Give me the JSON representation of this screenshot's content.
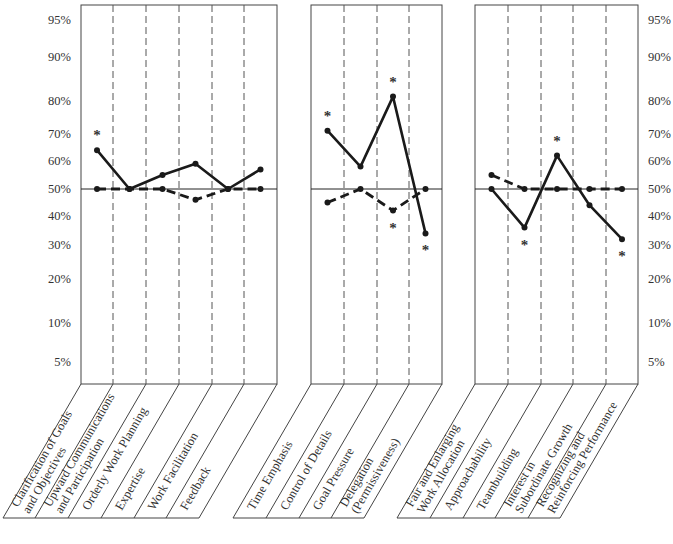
{
  "chart_data": [
    {
      "type": "line",
      "panel": "left",
      "title": "",
      "categories": [
        "Clarification of Goals and Objectives",
        "Upward Communications and Participation",
        "Orderly Work Planning",
        "Expertise",
        "Work Facilitation",
        "Feedback"
      ],
      "category_lines": [
        [
          "Clarification of Goals",
          "and Objectives"
        ],
        [
          "Upward Communications",
          "and Participation"
        ],
        [
          "Orderly Work Planning"
        ],
        [
          "Expertise"
        ],
        [
          "Work Facilitation"
        ],
        [
          "Feedback"
        ]
      ],
      "series": [
        {
          "name": "solid",
          "style": "solid",
          "values": [
            64,
            50,
            55,
            59,
            50,
            57
          ]
        },
        {
          "name": "dashed",
          "style": "dashed",
          "values": [
            50,
            50,
            50,
            46,
            50,
            50
          ]
        }
      ],
      "significance_markers": [
        {
          "series": "solid",
          "index": 0,
          "position": "above"
        }
      ],
      "ylabel": "",
      "xlabel": "",
      "yticks": [
        "95%",
        "90%",
        "80%",
        "70%",
        "60%",
        "50%",
        "40%",
        "30%",
        "20%",
        "10%",
        "5%"
      ],
      "ytick_side": "left",
      "reference_line": 50,
      "ylim": [
        2,
        98
      ]
    },
    {
      "type": "line",
      "panel": "middle",
      "categories": [
        "Time Emphasis",
        "Control of Details",
        "Goal Pressure",
        "Delegation (Permissiveness)"
      ],
      "category_lines": [
        [
          "Time Emphasis"
        ],
        [
          "Control of Details"
        ],
        [
          "Goal Pressure"
        ],
        [
          "Delegation",
          "(Permissiveness)"
        ]
      ],
      "series": [
        {
          "name": "solid",
          "style": "solid",
          "values": [
            71,
            58,
            81,
            34
          ]
        },
        {
          "name": "dashed",
          "style": "dashed",
          "values": [
            45,
            50,
            42,
            50
          ]
        }
      ],
      "significance_markers": [
        {
          "series": "solid",
          "index": 0,
          "position": "above"
        },
        {
          "series": "solid",
          "index": 2,
          "position": "above"
        },
        {
          "series": "dashed",
          "index": 2,
          "position": "below"
        },
        {
          "series": "solid",
          "index": 3,
          "position": "below"
        }
      ],
      "reference_line": 50,
      "ylim": [
        2,
        98
      ]
    },
    {
      "type": "line",
      "panel": "right",
      "categories": [
        "Fair and Enlarging Work Allocation",
        "Approachability",
        "Teambuilding",
        "Interest in Subordinate Growth",
        "Recognizing and Reinforcing Performance"
      ],
      "category_lines": [
        [
          "Fair and Enlarging",
          "Work Allocation"
        ],
        [
          "Approachability"
        ],
        [
          "Teambuilding"
        ],
        [
          "Interest in",
          "Subordinate Growth"
        ],
        [
          "Recognizing and",
          "Reinforcing Performance"
        ]
      ],
      "series": [
        {
          "name": "solid",
          "style": "solid",
          "values": [
            50,
            36,
            62,
            44,
            32
          ]
        },
        {
          "name": "dashed",
          "style": "dashed",
          "values": [
            55,
            50,
            50,
            50,
            50
          ]
        }
      ],
      "significance_markers": [
        {
          "series": "solid",
          "index": 1,
          "position": "below"
        },
        {
          "series": "solid",
          "index": 2,
          "position": "above"
        },
        {
          "series": "solid",
          "index": 4,
          "position": "below"
        }
      ],
      "yticks": [
        "95%",
        "90%",
        "80%",
        "70%",
        "60%",
        "50%",
        "40%",
        "30%",
        "20%",
        "10%",
        "5%"
      ],
      "ytick_side": "right",
      "reference_line": 50,
      "ylim": [
        2,
        98
      ]
    }
  ],
  "axis": {
    "ticks": [
      {
        "label": "95%",
        "value": 95,
        "y": 20
      },
      {
        "label": "90%",
        "value": 90,
        "y": 57
      },
      {
        "label": "80%",
        "value": 80,
        "y": 101
      },
      {
        "label": "70%",
        "value": 70,
        "y": 134
      },
      {
        "label": "60%",
        "value": 60,
        "y": 161
      },
      {
        "label": "50%",
        "value": 50,
        "y": 189
      },
      {
        "label": "40%",
        "value": 40,
        "y": 216
      },
      {
        "label": "30%",
        "value": 30,
        "y": 245
      },
      {
        "label": "20%",
        "value": 20,
        "y": 279
      },
      {
        "label": "10%",
        "value": 10,
        "y": 323
      },
      {
        "label": "5%",
        "value": 5,
        "y": 362
      }
    ]
  },
  "marker_glyph": "*",
  "colors": {
    "line": "#1a1a1a",
    "grid": "#555555",
    "text": "#333333"
  }
}
